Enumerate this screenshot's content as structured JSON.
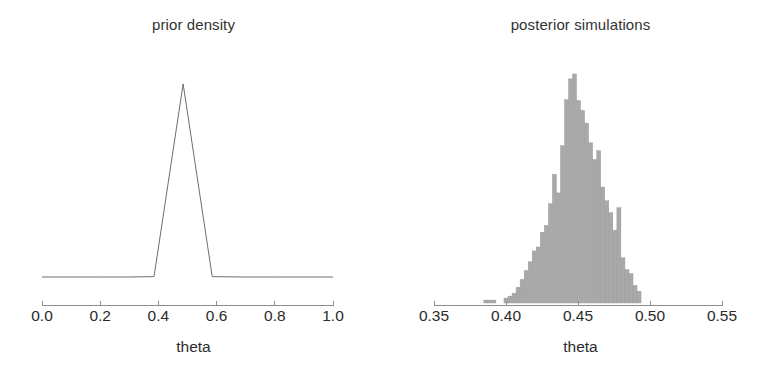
{
  "figure": {
    "width": 774,
    "height": 376,
    "background": "#ffffff",
    "line_color": "#6d6d6d",
    "bar_color": "#a9a9a9",
    "axis_color": "#8e8e8e",
    "text_color": "#2b2b2b"
  },
  "panels": {
    "prior": {
      "title": "prior density",
      "xlabel": "theta",
      "tick_labels": [
        "0.0",
        "0.2",
        "0.4",
        "0.6",
        "0.8",
        "1.0"
      ],
      "tick_values": [
        0.0,
        0.2,
        0.4,
        0.6,
        0.8,
        1.0
      ]
    },
    "posterior": {
      "title": "posterior simulations",
      "xlabel": "theta",
      "tick_labels": [
        "0.35",
        "0.40",
        "0.45",
        "0.50",
        "0.55"
      ],
      "tick_values": [
        0.35,
        0.4,
        0.45,
        0.5,
        0.55
      ]
    }
  },
  "chart_data": [
    {
      "type": "line",
      "title": "prior density",
      "xlabel": "theta",
      "ylabel": "",
      "xlim": [
        0.0,
        1.0
      ],
      "ylim": [
        0,
        10.5
      ],
      "grid": false,
      "legend": "none",
      "description": "Triangular spike prior on theta: near-flat low density across [0,1] with a sharp symmetric triangular peak centred at theta = 0.485.",
      "x": [
        0.0,
        0.1,
        0.2,
        0.3,
        0.385,
        0.485,
        0.585,
        0.7,
        0.8,
        0.9,
        1.0
      ],
      "values": [
        0.3,
        0.3,
        0.3,
        0.3,
        0.32,
        10.0,
        0.32,
        0.3,
        0.3,
        0.3,
        0.3
      ]
    },
    {
      "type": "bar",
      "title": "posterior simulations",
      "xlabel": "theta",
      "ylabel": "",
      "xlim": [
        0.35,
        0.55
      ],
      "ylim": [
        0,
        235
      ],
      "grid": false,
      "legend": "none",
      "description": "Histogram of posterior simulation draws of theta; unimodal, slightly right-skewed, concentrated between 0.405 and 0.495 with mode near 0.447.",
      "bin_width": 0.0028,
      "categories": [
        0.386,
        0.3888,
        0.3916,
        0.4,
        0.4028,
        0.4056,
        0.4084,
        0.4112,
        0.414,
        0.4168,
        0.4196,
        0.4224,
        0.4252,
        0.428,
        0.4308,
        0.4336,
        0.4364,
        0.4392,
        0.442,
        0.4448,
        0.4476,
        0.4504,
        0.4532,
        0.456,
        0.4588,
        0.4616,
        0.4644,
        0.4672,
        0.47,
        0.4728,
        0.4756,
        0.4784,
        0.4812,
        0.484,
        0.4868,
        0.4896,
        0.4924
      ],
      "values": [
        3,
        3,
        3,
        5,
        7,
        10,
        16,
        24,
        33,
        42,
        53,
        57,
        72,
        79,
        101,
        131,
        112,
        160,
        207,
        228,
        233,
        206,
        196,
        183,
        163,
        146,
        155,
        118,
        104,
        92,
        74,
        97,
        46,
        34,
        30,
        18,
        12
      ]
    }
  ]
}
